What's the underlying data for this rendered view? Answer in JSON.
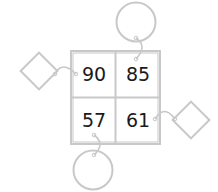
{
  "diagram": {
    "type": "number-grid-puzzle",
    "grid": {
      "rows": 2,
      "cols": 2,
      "cells": [
        {
          "row": 0,
          "col": 0,
          "value": "90"
        },
        {
          "row": 0,
          "col": 1,
          "value": "85"
        },
        {
          "row": 1,
          "col": 0,
          "value": "57"
        },
        {
          "row": 1,
          "col": 1,
          "value": "61"
        }
      ]
    },
    "answer_shapes": [
      {
        "shape": "diamond",
        "position": "left",
        "attached_to": "90",
        "content": ""
      },
      {
        "shape": "circle",
        "position": "top",
        "attached_to": "85",
        "content": ""
      },
      {
        "shape": "diamond",
        "position": "right",
        "attached_to": "61",
        "content": ""
      },
      {
        "shape": "circle",
        "position": "bottom",
        "attached_to": "57",
        "content": ""
      }
    ],
    "colors": {
      "line": "#c8c8c8",
      "text": "#1a1a1a",
      "background": "#ffffff"
    }
  }
}
